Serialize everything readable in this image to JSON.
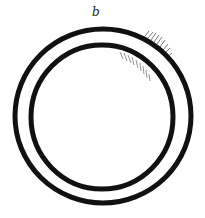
{
  "diagram": {
    "label": "b",
    "stroke_color": "#111111",
    "hatch_color": "#555555",
    "outer_ring": {
      "cx": 103,
      "cy": 116,
      "rx": 88,
      "ry": 87
    },
    "inner_ring": {
      "cx": 102,
      "cy": 117,
      "rx": 71,
      "ry": 72
    }
  }
}
